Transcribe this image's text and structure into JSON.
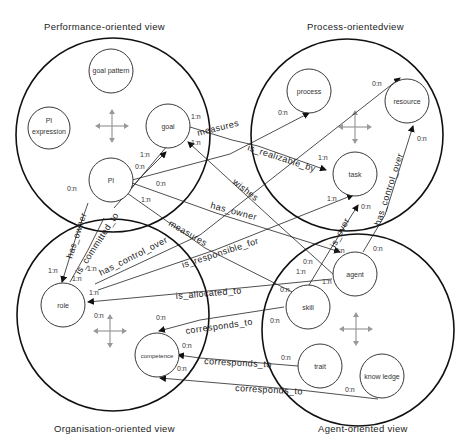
{
  "views": [
    {
      "id": "performance",
      "title": "Performance-oriented view"
    },
    {
      "id": "process",
      "title": "Process-orientedview"
    },
    {
      "id": "organisation",
      "title": "Organisation-oriented view"
    },
    {
      "id": "agent",
      "title": "Agent-oriented view"
    }
  ],
  "nodes": {
    "goal_pattern": "goal pattern",
    "pi_expression_1": "PI",
    "pi_expression_2": "expression",
    "goal": "goal",
    "pi": "PI",
    "process": "process",
    "resource": "resource",
    "task": "task",
    "role": "role",
    "competence": "competence",
    "agent": "agent",
    "skill": "skill",
    "trait": "trait",
    "knowledge": "know ledge"
  },
  "relations": {
    "measures_goal": "measures",
    "is_realizable_by": "is_realizable_by",
    "wishes": "wishes",
    "has_owner_pi_agent": "has_owner",
    "measures_pi_skill": "measures",
    "is_responsible_for": "is_responsible_for",
    "is_allocated_to": "is_allocated_to",
    "has_owner_pi_role": "has_owner",
    "is_committed_to": "is_committed_to",
    "has_control_over_role": "has_control_over",
    "is_over": "is_over",
    "has_control_over_agent": "has_control_over",
    "corresponds_to_skill": "corresponds_to",
    "corresponds_to_trait": "corresponds_to",
    "corresponds_to_knowledge": "corresponds_to"
  },
  "multiplicities": {
    "goal_1": "1:n",
    "goal_2": "1:n",
    "pi_1": "1:n",
    "pi_2": "0:n",
    "pi_3": "0:n",
    "pi_4": "1:n",
    "pi_5": "0:n",
    "process_1": "0:n",
    "resource_1": "0:n",
    "resource_2": "0:n",
    "task_1": "1:n",
    "task_2": "1:n",
    "task_3": "0:n",
    "role_1": "1:n",
    "role_2": "1:n",
    "role_3": "1:n",
    "role_4": "1:n",
    "role_5": "0:n",
    "comp_1": "0:n",
    "comp_2": "0:n",
    "comp_3": "0:n",
    "agent_1": "0:n",
    "agent_2": "0:n",
    "agent_3": "0:n",
    "agent_4": "1:n",
    "agent_5": "1:n",
    "skill_1": "0:n",
    "skill_2": "0:n",
    "trait_1": "0:n",
    "know_1": "0:n"
  },
  "colors": {
    "line": "#222222",
    "move_icon": "#999999",
    "background": "#ffffff"
  }
}
